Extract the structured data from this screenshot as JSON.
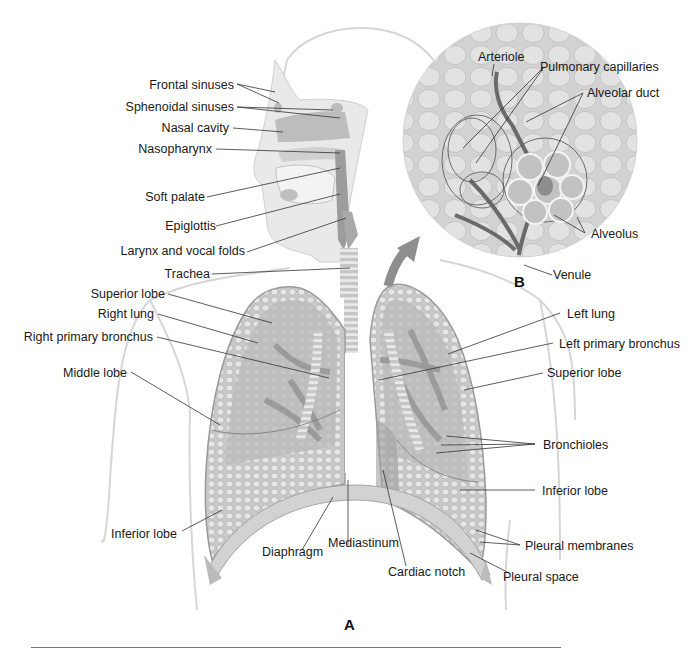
{
  "figure": {
    "panel_a_label": "A",
    "panel_b_label": "B"
  },
  "labels": {
    "head": [
      {
        "id": "frontal-sinuses",
        "text": "Frontal sinuses"
      },
      {
        "id": "sphenoidal-sinuses",
        "text": "Sphenoidal sinuses"
      },
      {
        "id": "nasal-cavity",
        "text": "Nasal cavity"
      },
      {
        "id": "nasopharynx",
        "text": "Nasopharynx"
      },
      {
        "id": "soft-palate",
        "text": "Soft palate"
      },
      {
        "id": "epiglottis",
        "text": "Epiglottis"
      },
      {
        "id": "larynx-vocal-folds",
        "text": "Larynx and vocal folds"
      },
      {
        "id": "trachea",
        "text": "Trachea"
      }
    ],
    "right_lung": [
      {
        "id": "superior-lobe-right",
        "text": "Superior lobe"
      },
      {
        "id": "right-lung",
        "text": "Right lung"
      },
      {
        "id": "right-primary-bronchus",
        "text": "Right primary bronchus"
      },
      {
        "id": "middle-lobe",
        "text": "Middle lobe"
      },
      {
        "id": "inferior-lobe-right",
        "text": "Inferior lobe"
      }
    ],
    "bottom": [
      {
        "id": "diaphragm",
        "text": "Diaphragm"
      },
      {
        "id": "mediastinum",
        "text": "Mediastinum"
      },
      {
        "id": "cardiac-notch",
        "text": "Cardiac notch"
      }
    ],
    "left_lung": [
      {
        "id": "left-lung",
        "text": "Left lung"
      },
      {
        "id": "left-primary-bronchus",
        "text": "Left primary bronchus"
      },
      {
        "id": "superior-lobe-left",
        "text": "Superior lobe"
      },
      {
        "id": "bronchioles",
        "text": "Bronchioles"
      },
      {
        "id": "inferior-lobe-left",
        "text": "Inferior lobe"
      },
      {
        "id": "pleural-membranes",
        "text": "Pleural membranes"
      },
      {
        "id": "pleural-space",
        "text": "Pleural space"
      }
    ],
    "inset": [
      {
        "id": "arteriole",
        "text": "Arteriole"
      },
      {
        "id": "pulmonary-capillaries",
        "text": "Pulmonary capillaries"
      },
      {
        "id": "alveolar-duct",
        "text": "Alveolar duct"
      },
      {
        "id": "alveolus",
        "text": "Alveolus"
      },
      {
        "id": "venule",
        "text": "Venule"
      }
    ]
  }
}
